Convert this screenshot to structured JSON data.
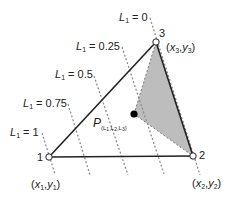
{
  "diagram": {
    "vertices": [
      {
        "id": "1",
        "label": "1",
        "coord_x": "x",
        "coord_x_sub": "1",
        "coord_y": "y",
        "coord_y_sub": "1"
      },
      {
        "id": "2",
        "label": "2",
        "coord_x": "x",
        "coord_x_sub": "2",
        "coord_y": "y",
        "coord_y_sub": "2"
      },
      {
        "id": "3",
        "label": "3",
        "coord_x": "x",
        "coord_x_sub": "3",
        "coord_y": "y",
        "coord_y_sub": "3"
      }
    ],
    "level_lines": [
      {
        "var": "L",
        "sub": "1",
        "eq": " = 0"
      },
      {
        "var": "L",
        "sub": "1",
        "eq": " = 0.25"
      },
      {
        "var": "L",
        "sub": "1",
        "eq": " = 0.5"
      },
      {
        "var": "L",
        "sub": "1",
        "eq": " = 0.75"
      },
      {
        "var": "L",
        "sub": "1",
        "eq": " = 1"
      }
    ],
    "point": {
      "name": "P",
      "sub": "(L1,L2,L3)",
      "sub_parts": [
        "(L",
        "1",
        ",L",
        "2",
        ",L",
        "3",
        ")"
      ]
    },
    "colors": {
      "edge": "#222222",
      "dashed": "#888888",
      "shade": "#bdbdbd",
      "point": "#000000"
    }
  }
}
